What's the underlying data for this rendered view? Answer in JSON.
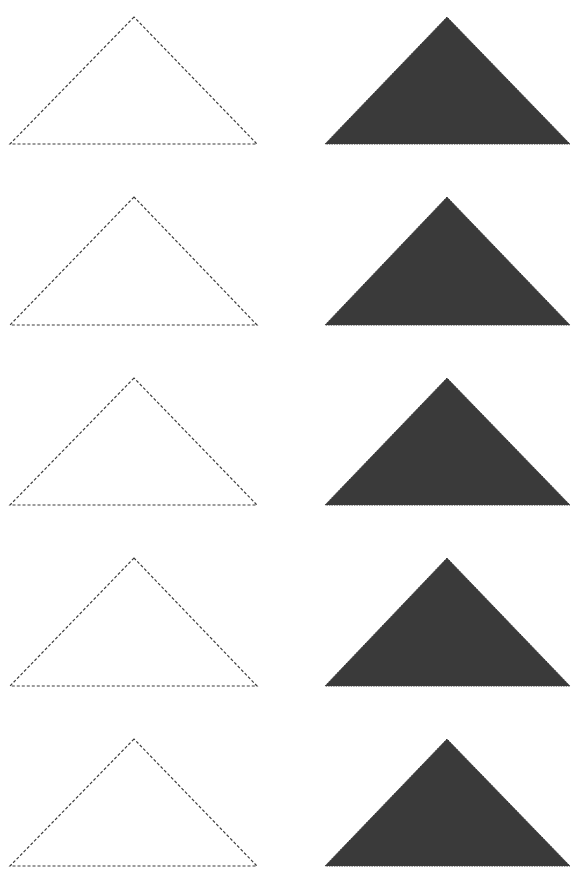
{
  "page": {
    "width": 578,
    "height": 880,
    "background": "#ffffff"
  },
  "style": {
    "outline_color": "#3c3c3c",
    "outline_dash": "3 2",
    "outline_width": 1.2,
    "fill_color": "#3a3a3a"
  },
  "rows": [
    {
      "outline": {
        "apex": [
          134,
          17
        ],
        "left": [
          10,
          144
        ],
        "right": [
          257,
          144
        ]
      },
      "filled": {
        "apex": [
          447,
          17
        ],
        "left": [
          325,
          144
        ],
        "right": [
          570,
          144
        ]
      }
    },
    {
      "outline": {
        "apex": [
          134,
          197
        ],
        "left": [
          10,
          325
        ],
        "right": [
          257,
          325
        ]
      },
      "filled": {
        "apex": [
          447,
          197
        ],
        "left": [
          325,
          325
        ],
        "right": [
          570,
          325
        ]
      }
    },
    {
      "outline": {
        "apex": [
          134,
          378
        ],
        "left": [
          10,
          505
        ],
        "right": [
          257,
          505
        ]
      },
      "filled": {
        "apex": [
          447,
          378
        ],
        "left": [
          325,
          505
        ],
        "right": [
          570,
          505
        ]
      }
    },
    {
      "outline": {
        "apex": [
          134,
          558
        ],
        "left": [
          10,
          686
        ],
        "right": [
          257,
          686
        ]
      },
      "filled": {
        "apex": [
          447,
          558
        ],
        "left": [
          325,
          686
        ],
        "right": [
          570,
          686
        ]
      }
    },
    {
      "outline": {
        "apex": [
          134,
          739
        ],
        "left": [
          10,
          866
        ],
        "right": [
          257,
          866
        ]
      },
      "filled": {
        "apex": [
          447,
          739
        ],
        "left": [
          325,
          866
        ],
        "right": [
          570,
          866
        ]
      }
    }
  ]
}
